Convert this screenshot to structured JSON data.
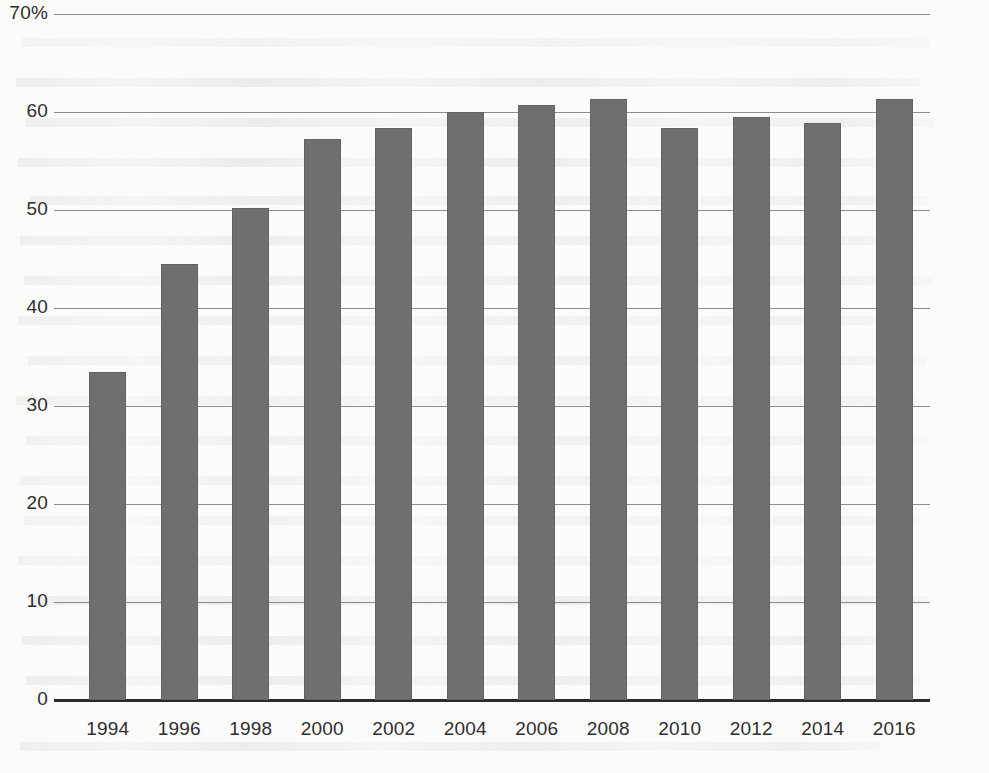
{
  "chart_data": {
    "type": "bar",
    "title": "",
    "subtitle": "",
    "xlabel": "",
    "ylabel": "",
    "categories": [
      "1994",
      "1996",
      "1998",
      "2000",
      "2002",
      "2004",
      "2006",
      "2008",
      "2010",
      "2012",
      "2014",
      "2016"
    ],
    "values": [
      33.5,
      44.5,
      50.2,
      57.2,
      58.4,
      60.0,
      60.7,
      61.3,
      58.4,
      59.5,
      58.9,
      61.3
    ],
    "series": [
      {
        "name": "",
        "values": [
          33.5,
          44.5,
          50.2,
          57.2,
          58.4,
          60.0,
          60.7,
          61.3,
          58.4,
          59.5,
          58.9,
          61.3
        ]
      }
    ],
    "ylim": [
      0,
      70
    ],
    "ytick_values": [
      0,
      10,
      20,
      30,
      40,
      50,
      60,
      70
    ],
    "ytick_labels": [
      "0",
      "10",
      "20",
      "30",
      "40",
      "50",
      "60",
      "70%"
    ],
    "xtick_labels": [
      "1994",
      "1996",
      "1998",
      "2000",
      "2002",
      "2004",
      "2006",
      "2008",
      "2010",
      "2012",
      "2014",
      "2016"
    ],
    "grid": true,
    "grid_axis": "y",
    "legend": false,
    "legend_position": "none",
    "bar_color": "#6f6f6f",
    "gridline_color": "#8c8c8c",
    "axis_color": "#2b2b2b",
    "background_color": "#fbfbfa",
    "annotations": []
  }
}
